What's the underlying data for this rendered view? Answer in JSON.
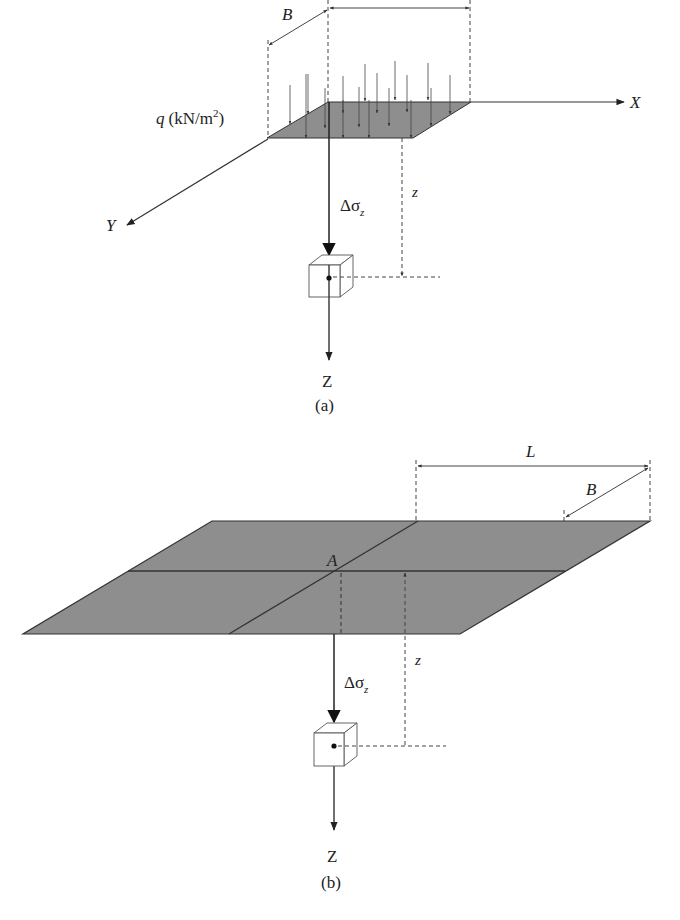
{
  "figure_a": {
    "dim_B": "B",
    "load_label": "q (kN/m²)",
    "axis_x": "X",
    "axis_y": "Y",
    "axis_z": "Z",
    "stress_label": "Δσ",
    "stress_sub": "z",
    "depth_label": "z",
    "caption": "(a)"
  },
  "figure_b": {
    "dim_L": "L",
    "dim_B": "B",
    "point_label": "A",
    "axis_z": "Z",
    "stress_label": "Δσ",
    "stress_sub": "z",
    "depth_label": "z",
    "caption": "(b)"
  },
  "colors": {
    "plate_fill": "#8e8e8e",
    "line": "#333333",
    "background": "#ffffff"
  }
}
